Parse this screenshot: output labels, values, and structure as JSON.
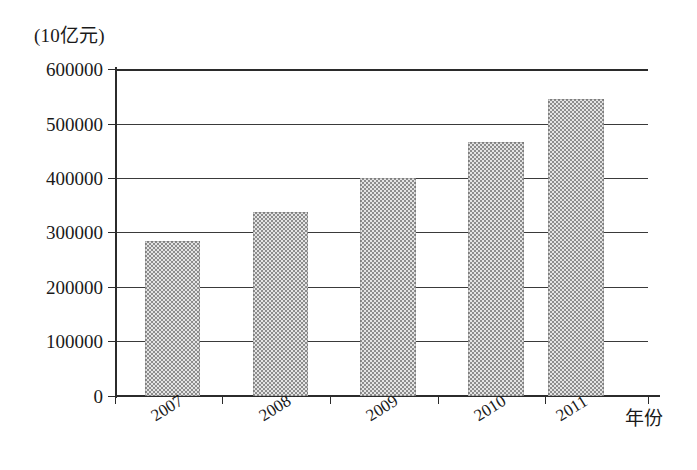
{
  "chart_data": {
    "type": "bar",
    "title": "",
    "subtitle": "",
    "xlabel": "年份",
    "ylabel": "(10亿元)",
    "categories": [
      "2007",
      "2008",
      "2009",
      "2010",
      "2011"
    ],
    "values": [
      285000,
      337000,
      400000,
      466000,
      545000
    ],
    "series": [
      {
        "name": "",
        "values": [
          285000,
          337000,
          400000,
          466000,
          545000
        ]
      }
    ],
    "ylim": [
      0,
      600000
    ],
    "yticks": [
      0,
      100000,
      200000,
      300000,
      400000,
      500000,
      600000
    ],
    "ytick_labels": [
      "0",
      "100000",
      "200000",
      "300000",
      "400000",
      "500000",
      "600000"
    ],
    "xtick_labels": [
      "2007",
      "2008",
      "2009",
      "2010",
      "2011"
    ],
    "grid": true,
    "grid_axis": "y",
    "legend": false,
    "legend_position": "none",
    "bar_fill": "#a8a8a8",
    "bar_pattern": "checkerboard-dither",
    "axis_color": "#2b2b2b",
    "background": "#ffffff"
  },
  "axes": {
    "y_unit_caption": "(10亿元)",
    "x_axis_caption": "年份"
  },
  "y_ticks": [
    {
      "label": "600000",
      "value": 600000
    },
    {
      "label": "500000",
      "value": 500000
    },
    {
      "label": "400000",
      "value": 400000
    },
    {
      "label": "300000",
      "value": 300000
    },
    {
      "label": "200000",
      "value": 200000
    },
    {
      "label": "100000",
      "value": 100000
    },
    {
      "label": "0",
      "value": 0
    }
  ],
  "bars": [
    {
      "label": "2007",
      "value": 285000
    },
    {
      "label": "2008",
      "value": 337000
    },
    {
      "label": "2009",
      "value": 400000
    },
    {
      "label": "2010",
      "value": 466000
    },
    {
      "label": "2011",
      "value": 545000
    }
  ]
}
